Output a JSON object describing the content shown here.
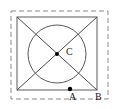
{
  "figure": {
    "background_color": "#ffffff",
    "canvas": {
      "width": 118,
      "height": 109
    },
    "stroke_color": "#555555",
    "dash_color": "#888888",
    "point_color": "#000000",
    "label_color": "#1a1a1a",
    "bounding_box": {
      "name": "dashed-bounding-rect",
      "x": 11,
      "y": 11,
      "width": 97,
      "height": 88,
      "style": "dashed"
    },
    "square": {
      "name": "outer-square",
      "x": 17,
      "y": 17,
      "width": 80,
      "height": 73,
      "style": "solid"
    },
    "circle": {
      "name": "inscribed-circle",
      "cx": 57,
      "cy": 54,
      "r": 29,
      "style": "solid"
    },
    "diagonals": [
      {
        "name": "diagonal-top-left-to-bottom-right",
        "x1": 17,
        "y1": 17,
        "x2": 97,
        "y2": 90
      },
      {
        "name": "diagonal-top-right-to-bottom-left",
        "x1": 97,
        "y1": 17,
        "x2": 17,
        "y2": 90
      }
    ],
    "points": [
      {
        "id": "C",
        "label": "C",
        "cx": 57,
        "cy": 54,
        "r": 2.0,
        "label_x": 66,
        "label_y": 47
      },
      {
        "id": "A",
        "label": "A",
        "cx": 70,
        "cy": 89,
        "r": 2.0,
        "label_x": 69,
        "label_y": 92
      },
      {
        "id": "B",
        "label": "B",
        "cx": 97,
        "cy": 90,
        "r": 0,
        "label_x": 95,
        "label_y": 92
      }
    ]
  }
}
